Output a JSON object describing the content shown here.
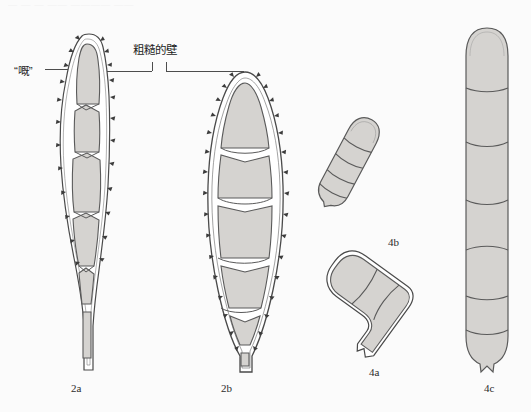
{
  "figure": {
    "background_color": "#fbfbfb",
    "fill_color": "#d5d3d0",
    "outline_color": "#4a4a4a",
    "top_partial_text": "—  —   —  ——  ————  ——"
  },
  "annotations": [
    {
      "id": "beak",
      "text": "“嘅”",
      "description": "beak-label-pointing-to-apex-of-2a"
    },
    {
      "id": "rough-wall",
      "text": "粗糙的壁",
      "description": "rough-wall-label-with-bracket-leaders"
    }
  ],
  "specimens": [
    {
      "id": "2a",
      "caption": "2a",
      "shape": "fusiform-spindle-with-apical-beak-and-tapering-pedicel",
      "wall": "ornamented-with-small-spines",
      "cell_count": 6
    },
    {
      "id": "2b",
      "caption": "2b",
      "shape": "broad-fusiform-pointed-both-ends",
      "wall": "densely-spiny",
      "cell_count": 7
    },
    {
      "id": "4b",
      "caption": "4b",
      "shape": "elongate-cylindrical-oblique",
      "wall": "smooth",
      "cell_count": 5
    },
    {
      "id": "4a",
      "caption": "4a",
      "shape": "clavate-obovoid-with-short-pedicel",
      "wall": "smooth-double-contour",
      "cell_count": 3
    },
    {
      "id": "4c",
      "caption": "4c",
      "shape": "long-cylindrical-vertical-rounded-apex",
      "wall": "smooth",
      "cell_count": 7
    }
  ]
}
